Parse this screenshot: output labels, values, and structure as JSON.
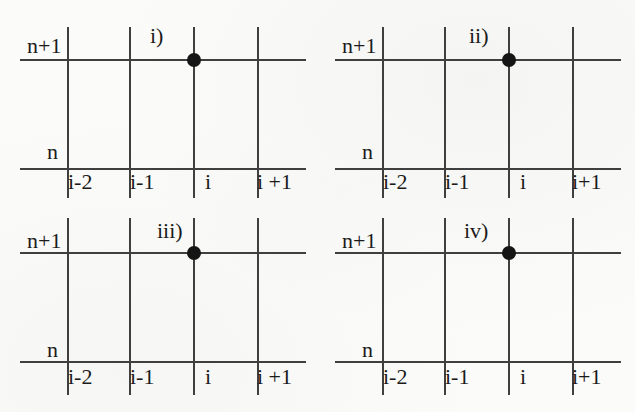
{
  "figure": {
    "background_color": "#fbfbf9",
    "line_color": "#3f3f3f",
    "dot_color": "#151515",
    "text_color": "#1b1b1b",
    "panels": [
      {
        "label": "i)",
        "row_labels": [
          "n+1",
          "n"
        ],
        "col_labels": [
          "i-2",
          "i-1",
          "i",
          "i +1"
        ],
        "dot_at": "(i, n+1)"
      },
      {
        "label": "ii)",
        "row_labels": [
          "n+1",
          "n"
        ],
        "col_labels": [
          "i-2",
          "i-1",
          "i",
          "i+1"
        ],
        "dot_at": "(i, n+1)"
      },
      {
        "label": "iii)",
        "row_labels": [
          "n+1",
          "n"
        ],
        "col_labels": [
          "i-2",
          "i-1",
          "i",
          "i +1"
        ],
        "dot_at": "(i, n+1)"
      },
      {
        "label": "iv)",
        "row_labels": [
          "n+1",
          "n"
        ],
        "col_labels": [
          "i-2",
          "i-1",
          "i",
          "i+1"
        ],
        "dot_at": "(i, n+1)"
      }
    ]
  }
}
